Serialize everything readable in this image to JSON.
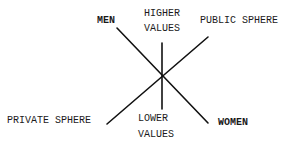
{
  "diagram": {
    "labels": {
      "men": "MEN",
      "higher_values_line1": "HIGHER",
      "higher_values_line2": "VALUES",
      "public_sphere": "PUBLIC SPHERE",
      "private_sphere": "PRIVATE SPHERE",
      "lower_values_line1": "LOWER",
      "lower_values_line2": "VALUES",
      "women": "WOMEN"
    },
    "axes": [
      {
        "from": "MEN",
        "to": "WOMEN"
      },
      {
        "from": "PUBLIC SPHERE",
        "to": "PRIVATE SPHERE"
      },
      {
        "from": "HIGHER VALUES",
        "to": "LOWER VALUES"
      }
    ],
    "line_color": "#111111",
    "text_color": "#1a1a1a"
  }
}
